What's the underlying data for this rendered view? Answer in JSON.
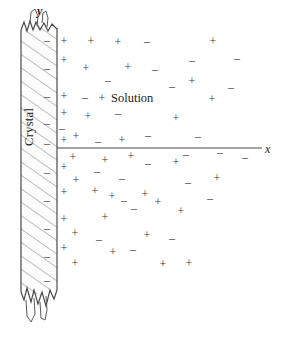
{
  "figure": {
    "background_color": "#ffffff",
    "ink_color": "#3a3a3a",
    "line_color": "#555555"
  },
  "labels": {
    "solution": "Solution",
    "crystal": "Crystal",
    "y_axis": "y",
    "x_axis": "x"
  },
  "axes": {
    "x_axis_line": {
      "x1": 57,
      "y1": 148,
      "x2": 262,
      "y2": 148
    },
    "y_axis_position": "top of crystal bar"
  },
  "crystal_bar": {
    "left": 21,
    "right": 57,
    "top": 22,
    "bottom": 292,
    "hatch_style": "diagonal",
    "break_top": true,
    "break_bottom": true
  },
  "surface_charges": {
    "sign": "minus",
    "x": 47,
    "y_positions": [
      40,
      68,
      96,
      123,
      143,
      172,
      200,
      228,
      256,
      280
    ]
  },
  "charges": [
    {
      "sign": "+",
      "x": 64,
      "y": 41
    },
    {
      "sign": "+",
      "x": 91,
      "y": 41
    },
    {
      "sign": "+",
      "x": 118,
      "y": 42
    },
    {
      "sign": "-",
      "x": 147,
      "y": 41
    },
    {
      "sign": "+",
      "x": 213,
      "y": 41
    },
    {
      "sign": "-",
      "x": 192,
      "y": 60
    },
    {
      "sign": "-",
      "x": 237,
      "y": 58
    },
    {
      "sign": "+",
      "x": 64,
      "y": 60
    },
    {
      "sign": "+",
      "x": 86,
      "y": 68
    },
    {
      "sign": "+",
      "x": 128,
      "y": 67
    },
    {
      "sign": "-",
      "x": 155,
      "y": 69
    },
    {
      "sign": "+",
      "x": 192,
      "y": 81
    },
    {
      "sign": "-",
      "x": 108,
      "y": 80
    },
    {
      "sign": "-",
      "x": 172,
      "y": 86
    },
    {
      "sign": "-",
      "x": 231,
      "y": 87
    },
    {
      "sign": "+",
      "x": 64,
      "y": 96
    },
    {
      "sign": "-",
      "x": 85,
      "y": 97
    },
    {
      "sign": "+",
      "x": 102,
      "y": 98
    },
    {
      "sign": "+",
      "x": 212,
      "y": 99
    },
    {
      "sign": "+",
      "x": 64,
      "y": 113
    },
    {
      "sign": "+",
      "x": 88,
      "y": 116
    },
    {
      "sign": "-",
      "x": 118,
      "y": 113
    },
    {
      "sign": "+",
      "x": 176,
      "y": 118
    },
    {
      "sign": "-",
      "x": 62,
      "y": 128
    },
    {
      "sign": "+",
      "x": 64,
      "y": 140
    },
    {
      "sign": "+",
      "x": 76,
      "y": 136
    },
    {
      "sign": "-",
      "x": 98,
      "y": 141
    },
    {
      "sign": "+",
      "x": 122,
      "y": 140
    },
    {
      "sign": "-",
      "x": 148,
      "y": 135
    },
    {
      "sign": "-",
      "x": 198,
      "y": 136
    },
    {
      "sign": "+",
      "x": 73,
      "y": 157
    },
    {
      "sign": "+",
      "x": 131,
      "y": 156
    },
    {
      "sign": "-",
      "x": 186,
      "y": 154
    },
    {
      "sign": "-",
      "x": 220,
      "y": 152
    },
    {
      "sign": "+",
      "x": 64,
      "y": 167
    },
    {
      "sign": "-",
      "x": 97,
      "y": 171
    },
    {
      "sign": "+",
      "x": 105,
      "y": 160
    },
    {
      "sign": "-",
      "x": 148,
      "y": 163
    },
    {
      "sign": "+",
      "x": 176,
      "y": 162
    },
    {
      "sign": "-",
      "x": 245,
      "y": 157
    },
    {
      "sign": "+",
      "x": 76,
      "y": 180
    },
    {
      "sign": "-",
      "x": 122,
      "y": 178
    },
    {
      "sign": "+",
      "x": 217,
      "y": 178
    },
    {
      "sign": "-",
      "x": 188,
      "y": 182
    },
    {
      "sign": "+",
      "x": 64,
      "y": 192
    },
    {
      "sign": "+",
      "x": 95,
      "y": 191
    },
    {
      "sign": "+",
      "x": 145,
      "y": 194
    },
    {
      "sign": "-",
      "x": 124,
      "y": 200
    },
    {
      "sign": "+",
      "x": 112,
      "y": 196
    },
    {
      "sign": "-",
      "x": 210,
      "y": 198
    },
    {
      "sign": "+",
      "x": 158,
      "y": 202
    },
    {
      "sign": "-",
      "x": 134,
      "y": 208
    },
    {
      "sign": "+",
      "x": 181,
      "y": 211
    },
    {
      "sign": "+",
      "x": 64,
      "y": 219
    },
    {
      "sign": "+",
      "x": 105,
      "y": 217
    },
    {
      "sign": "+",
      "x": 75,
      "y": 233
    },
    {
      "sign": "-",
      "x": 99,
      "y": 239
    },
    {
      "sign": "+",
      "x": 147,
      "y": 235
    },
    {
      "sign": "-",
      "x": 172,
      "y": 238
    },
    {
      "sign": "+",
      "x": 64,
      "y": 248
    },
    {
      "sign": "+",
      "x": 113,
      "y": 252
    },
    {
      "sign": "-",
      "x": 133,
      "y": 249
    },
    {
      "sign": "+",
      "x": 75,
      "y": 263
    },
    {
      "sign": "+",
      "x": 163,
      "y": 264
    },
    {
      "sign": "+",
      "x": 189,
      "y": 263
    }
  ]
}
